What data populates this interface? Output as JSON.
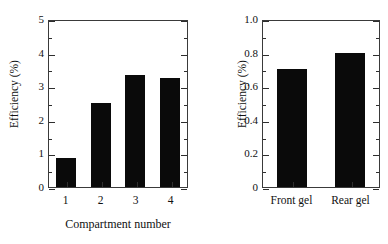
{
  "figure": {
    "background": "#ffffff",
    "bar_color": "#0a0a0a",
    "axis_color": "#2e2e2e"
  },
  "panel_a": {
    "letter": "(A)",
    "ylabel": "Efficiency (%)",
    "xlabel": "Compartment number",
    "ytick_labels": [
      "0",
      "1",
      "2",
      "3",
      "4",
      "5"
    ],
    "xtick_labels": [
      "1",
      "2",
      "3",
      "4"
    ]
  },
  "panel_b": {
    "letter": "(B)",
    "ylabel": "Efficiency (%)",
    "xlabel": "",
    "ytick_labels": [
      "0",
      "0.2",
      "0.4",
      "0.6",
      "0.8",
      "1.0"
    ],
    "xtick_labels": [
      "Front gel",
      "Rear gel"
    ]
  },
  "chart_data": [
    {
      "type": "bar",
      "panel": "(A)",
      "title": "",
      "xlabel": "Compartment number",
      "ylabel": "Efficiency (%)",
      "categories": [
        "1",
        "2",
        "3",
        "4"
      ],
      "values": [
        0.87,
        2.5,
        3.32,
        3.25
      ],
      "ylim": [
        0,
        5
      ],
      "ytick_major": [
        0,
        1,
        2,
        3,
        4,
        5
      ],
      "ytick_minor_step": 0.5,
      "grid": false,
      "legend": "none",
      "bar_color": "#0a0a0a"
    },
    {
      "type": "bar",
      "panel": "(B)",
      "title": "",
      "xlabel": "",
      "ylabel": "Efficiency (%)",
      "categories": [
        "Front gel",
        "Rear gel"
      ],
      "values": [
        0.7,
        0.795
      ],
      "ylim": [
        0,
        1.0
      ],
      "ytick_major": [
        0,
        0.2,
        0.4,
        0.6,
        0.8,
        1.0
      ],
      "ytick_minor_step": 0.1,
      "grid": false,
      "legend": "none",
      "bar_color": "#0a0a0a"
    }
  ]
}
